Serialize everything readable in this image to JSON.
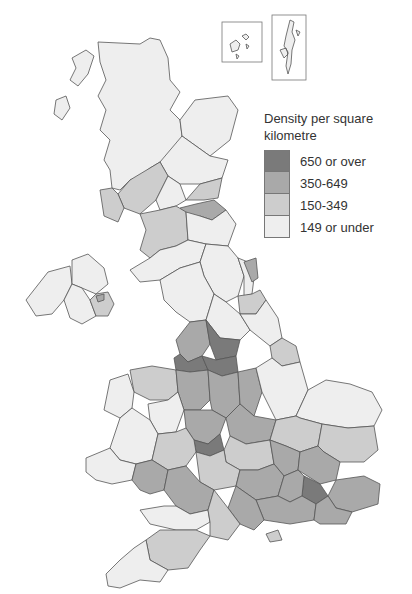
{
  "legend": {
    "title": "Density per square kilometre",
    "items": [
      {
        "label": "650 or over",
        "color": "#7a7a7a"
      },
      {
        "label": "350-649",
        "color": "#a9a9a9"
      },
      {
        "label": "150-349",
        "color": "#cdcdcd"
      },
      {
        "label": "149 or under",
        "color": "#eeeeee"
      }
    ]
  },
  "map": {
    "title": "United Kingdom population density by county/region",
    "insets": [
      "Orkney",
      "Shetland"
    ]
  }
}
